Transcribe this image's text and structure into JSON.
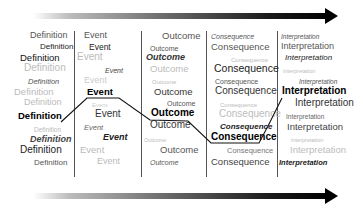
{
  "diagram": {
    "columns": [
      {
        "name": "definition",
        "words": [
          {
            "text": "Definition",
            "x": 30,
            "y": 40,
            "size": 9,
            "color": "#555",
            "weight": "normal",
            "style": "normal"
          },
          {
            "text": "Definition",
            "x": 40,
            "y": 51,
            "size": 8,
            "color": "#222",
            "weight": "normal",
            "style": "normal"
          },
          {
            "text": "Definition",
            "x": 20,
            "y": 62,
            "size": 9.5,
            "color": "#111",
            "weight": "normal",
            "style": "normal"
          },
          {
            "text": "Definition",
            "x": 24,
            "y": 73,
            "size": 10,
            "color": "#bbb",
            "weight": "normal",
            "style": "normal"
          },
          {
            "text": "Definition",
            "x": 28,
            "y": 85,
            "size": 7.5,
            "color": "#555",
            "weight": "normal",
            "style": "italic"
          },
          {
            "text": "Definition",
            "x": 14,
            "y": 96,
            "size": 9.5,
            "color": "#bbb",
            "weight": "normal",
            "style": "normal"
          },
          {
            "text": "Definition",
            "x": 24,
            "y": 107,
            "size": 9,
            "color": "#bbb",
            "weight": "normal",
            "style": "normal"
          },
          {
            "text": "Definition",
            "x": 18,
            "y": 120,
            "size": 9.5,
            "color": "#000",
            "weight": "bold",
            "style": "normal"
          },
          {
            "text": "Definition",
            "x": 34,
            "y": 133,
            "size": 6.5,
            "color": "#bbb",
            "weight": "normal",
            "style": "normal"
          },
          {
            "text": "Definition",
            "x": 30,
            "y": 144,
            "size": 9,
            "color": "#444",
            "weight": "bold",
            "style": "italic"
          },
          {
            "text": "Definition",
            "x": 20,
            "y": 155,
            "size": 10,
            "color": "#222",
            "weight": "normal",
            "style": "normal"
          },
          {
            "text": "Definition",
            "x": 34,
            "y": 167,
            "size": 8,
            "color": "#555",
            "weight": "normal",
            "style": "normal"
          }
        ]
      },
      {
        "name": "event",
        "words": [
          {
            "text": "Event",
            "x": 84,
            "y": 40,
            "size": 9,
            "color": "#555",
            "weight": "normal",
            "style": "normal"
          },
          {
            "text": "Event",
            "x": 89,
            "y": 51,
            "size": 8.5,
            "color": "#222",
            "weight": "normal",
            "style": "normal"
          },
          {
            "text": "Event",
            "x": 77,
            "y": 62,
            "size": 10,
            "color": "#bbb",
            "weight": "normal",
            "style": "normal"
          },
          {
            "text": "Event",
            "x": 105,
            "y": 74,
            "size": 7,
            "color": "#444",
            "weight": "normal",
            "style": "italic"
          },
          {
            "text": "Event",
            "x": 84,
            "y": 85,
            "size": 9,
            "color": "#ccc",
            "weight": "normal",
            "style": "normal"
          },
          {
            "text": "Event",
            "x": 87,
            "y": 96,
            "size": 9.5,
            "color": "#000",
            "weight": "bold",
            "style": "normal"
          },
          {
            "text": "Event",
            "x": 92,
            "y": 108,
            "size": 6,
            "color": "#ccc",
            "weight": "normal",
            "style": "normal"
          },
          {
            "text": "Event",
            "x": 95,
            "y": 119,
            "size": 10,
            "color": "#333",
            "weight": "normal",
            "style": "normal"
          },
          {
            "text": "Event",
            "x": 84,
            "y": 131,
            "size": 7.5,
            "color": "#666",
            "weight": "normal",
            "style": "italic"
          },
          {
            "text": "Event",
            "x": 103,
            "y": 142,
            "size": 9,
            "color": "#222",
            "weight": "bold",
            "style": "italic"
          },
          {
            "text": "Event",
            "x": 80,
            "y": 154,
            "size": 9.5,
            "color": "#bbb",
            "weight": "normal",
            "style": "normal"
          },
          {
            "text": "Event",
            "x": 97,
            "y": 166,
            "size": 9,
            "color": "#bbb",
            "weight": "normal",
            "style": "normal"
          }
        ]
      },
      {
        "name": "outcome",
        "words": [
          {
            "text": "Outcome",
            "x": 162,
            "y": 40,
            "size": 9.5,
            "color": "#555",
            "weight": "normal",
            "style": "normal"
          },
          {
            "text": "Outcome",
            "x": 150,
            "y": 52,
            "size": 7,
            "color": "#555",
            "weight": "normal",
            "style": "normal"
          },
          {
            "text": "Outcome",
            "x": 146,
            "y": 62,
            "size": 9,
            "color": "#333",
            "weight": "bold",
            "style": "italic"
          },
          {
            "text": "Outcome",
            "x": 150,
            "y": 73,
            "size": 9.5,
            "color": "#bbb",
            "weight": "normal",
            "style": "normal"
          },
          {
            "text": "Outcome",
            "x": 152,
            "y": 85,
            "size": 6,
            "color": "#bbb",
            "weight": "normal",
            "style": "normal"
          },
          {
            "text": "Outcome",
            "x": 154,
            "y": 96,
            "size": 9.5,
            "color": "#333",
            "weight": "normal",
            "style": "normal"
          },
          {
            "text": "Outcome",
            "x": 167,
            "y": 107,
            "size": 7,
            "color": "#555",
            "weight": "normal",
            "style": "normal"
          },
          {
            "text": "Outcome",
            "x": 151,
            "y": 118,
            "size": 10,
            "color": "#000",
            "weight": "bold",
            "style": "normal"
          },
          {
            "text": "Outcome",
            "x": 150,
            "y": 130,
            "size": 10,
            "color": "#333",
            "weight": "normal",
            "style": "normal"
          },
          {
            "text": "Outcome",
            "x": 144,
            "y": 143,
            "size": 5.5,
            "color": "#bbb",
            "weight": "normal",
            "style": "normal"
          },
          {
            "text": "Outcome",
            "x": 160,
            "y": 154,
            "size": 9.5,
            "color": "#555",
            "weight": "normal",
            "style": "normal"
          },
          {
            "text": "Outcome",
            "x": 150,
            "y": 166,
            "size": 7,
            "color": "#555",
            "weight": "normal",
            "style": "italic"
          }
        ]
      },
      {
        "name": "consequence",
        "words": [
          {
            "text": "Consequence",
            "x": 211,
            "y": 40,
            "size": 7,
            "color": "#555",
            "weight": "normal",
            "style": "italic"
          },
          {
            "text": "Consequence",
            "x": 211,
            "y": 51,
            "size": 9.5,
            "color": "#555",
            "weight": "normal",
            "style": "normal"
          },
          {
            "text": "Consequence",
            "x": 231,
            "y": 63,
            "size": 6,
            "color": "#bbb",
            "weight": "normal",
            "style": "normal"
          },
          {
            "text": "Consequence",
            "x": 214,
            "y": 73,
            "size": 10.5,
            "color": "#222",
            "weight": "normal",
            "style": "normal"
          },
          {
            "text": "Consequence",
            "x": 215,
            "y": 85,
            "size": 7,
            "color": "#555",
            "weight": "normal",
            "style": "normal"
          },
          {
            "text": "Consequence",
            "x": 215,
            "y": 96,
            "size": 10,
            "color": "#333",
            "weight": "normal",
            "style": "normal"
          },
          {
            "text": "Consequence",
            "x": 220,
            "y": 108,
            "size": 6,
            "color": "#bbb",
            "weight": "normal",
            "style": "normal"
          },
          {
            "text": "Consequence",
            "x": 219,
            "y": 119,
            "size": 10,
            "color": "#bbb",
            "weight": "normal",
            "style": "normal"
          },
          {
            "text": "Consequence",
            "x": 220,
            "y": 131,
            "size": 8,
            "color": "#222",
            "weight": "bold",
            "style": "italic"
          },
          {
            "text": "Consequence",
            "x": 211,
            "y": 142,
            "size": 10,
            "color": "#000",
            "weight": "bold",
            "style": "normal"
          },
          {
            "text": "Consequence",
            "x": 227,
            "y": 154,
            "size": 7.5,
            "color": "#777",
            "weight": "normal",
            "style": "normal"
          },
          {
            "text": "Consequence",
            "x": 211,
            "y": 166,
            "size": 9.5,
            "color": "#444",
            "weight": "normal",
            "style": "normal"
          }
        ]
      },
      {
        "name": "interpretation",
        "words": [
          {
            "text": "Interpretation",
            "x": 281,
            "y": 40,
            "size": 6.5,
            "color": "#555",
            "weight": "normal",
            "style": "italic"
          },
          {
            "text": "Interpretation",
            "x": 281,
            "y": 51,
            "size": 9,
            "color": "#555",
            "weight": "normal",
            "style": "normal"
          },
          {
            "text": "Interpretation",
            "x": 285,
            "y": 62,
            "size": 8,
            "color": "#222",
            "weight": "normal",
            "style": "italic"
          },
          {
            "text": "Interpretation",
            "x": 283,
            "y": 74,
            "size": 5.5,
            "color": "#bbb",
            "weight": "normal",
            "style": "normal"
          },
          {
            "text": "Interpretation",
            "x": 299,
            "y": 85,
            "size": 6.5,
            "color": "#555",
            "weight": "normal",
            "style": "italic"
          },
          {
            "text": "Interpretation",
            "x": 282,
            "y": 96,
            "size": 10,
            "color": "#000",
            "weight": "bold",
            "style": "normal"
          },
          {
            "text": "Interpretation",
            "x": 295,
            "y": 108,
            "size": 10,
            "color": "#333",
            "weight": "normal",
            "style": "normal"
          },
          {
            "text": "Interpretation",
            "x": 286,
            "y": 120,
            "size": 6.5,
            "color": "#666",
            "weight": "normal",
            "style": "normal"
          },
          {
            "text": "Interpretation",
            "x": 287,
            "y": 131,
            "size": 9.5,
            "color": "#444",
            "weight": "normal",
            "style": "normal"
          },
          {
            "text": "Interpretation",
            "x": 291,
            "y": 143,
            "size": 5.5,
            "color": "#bbb",
            "weight": "normal",
            "style": "normal"
          },
          {
            "text": "Interpretation",
            "x": 290,
            "y": 154,
            "size": 9.5,
            "color": "#bbb",
            "weight": "normal",
            "style": "normal"
          },
          {
            "text": "Interpretation",
            "x": 279,
            "y": 166,
            "size": 7.5,
            "color": "#222",
            "weight": "bold",
            "style": "italic"
          }
        ]
      }
    ],
    "dividers_x": [
      74,
      141,
      206,
      277
    ],
    "path_points": "61,122 87,98 119,98 150,120 188,121 211,143 259,143 268,126 282,98",
    "path_color": "#111111",
    "arrow_top_y": 13,
    "arrow_bottom_y": 193
  }
}
